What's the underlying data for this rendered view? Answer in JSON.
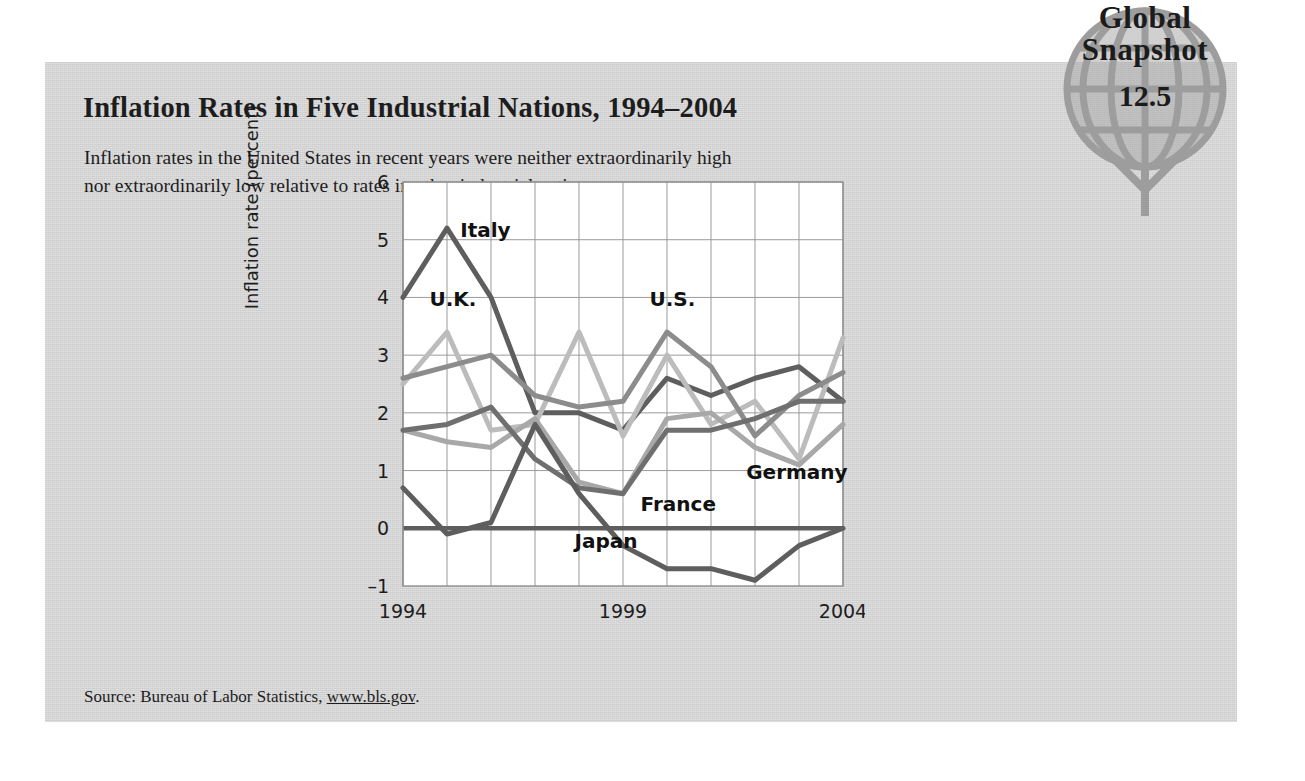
{
  "badge": {
    "line1": "Global",
    "line2": "Snapshot",
    "number": "12.5",
    "icon": "globe-icon",
    "color": "#a9a9a9"
  },
  "card": {
    "title": "Inflation Rates in Five Industrial Nations, 1994–2004",
    "subtitle": "Inflation rates in the United States in recent years were neither extraordinarily high nor extraordinarily low relative to rates in other industrial nations.",
    "source_prefix": "Source: Bureau of Labor Statistics, ",
    "source_url": "www.bls.gov",
    "source_suffix": ".",
    "background": "#d2d2d2"
  },
  "chart_data": {
    "type": "line",
    "title": "Inflation Rates in Five Industrial Nations, 1994–2004",
    "xlabel": "",
    "ylabel": "Inflation rate (percent)",
    "grid": true,
    "legend_position": "inline-annotations",
    "xlim": [
      1994,
      2004
    ],
    "ylim": [
      -1,
      6
    ],
    "yticks": [
      -1,
      0,
      1,
      2,
      3,
      4,
      5,
      6
    ],
    "ytick_labels": [
      "–1",
      "0",
      "1",
      "2",
      "3",
      "4",
      "5",
      "6"
    ],
    "x": [
      1994,
      1995,
      1996,
      1997,
      1998,
      1999,
      2000,
      2001,
      2002,
      2003,
      2004
    ],
    "xtick_labels": [
      "1994",
      "",
      "",
      "",
      "",
      "1999",
      "",
      "",
      "",
      "",
      "2004"
    ],
    "series": [
      {
        "name": "Italy",
        "color": "#5e5e5e",
        "label_x": 1995.3,
        "label_y": 5.05,
        "values": [
          4.0,
          5.2,
          4.0,
          2.0,
          2.0,
          1.7,
          2.6,
          2.3,
          2.6,
          2.8,
          2.2
        ]
      },
      {
        "name": "U.K.",
        "color": "#bcbcbc",
        "label_x": 1994.6,
        "label_y": 3.85,
        "values": [
          2.5,
          3.4,
          1.7,
          1.8,
          3.4,
          1.6,
          3.0,
          1.8,
          2.2,
          1.2,
          3.3
        ]
      },
      {
        "name": "U.S.",
        "color": "#8c8c8c",
        "label_x": 1999.6,
        "label_y": 3.85,
        "values": [
          2.6,
          2.8,
          3.0,
          2.3,
          2.1,
          2.2,
          3.4,
          2.8,
          1.6,
          2.3,
          2.7
        ]
      },
      {
        "name": "Germany",
        "color": "#a8a8a8",
        "label_x": 2001.8,
        "label_y": 0.85,
        "values": [
          1.7,
          1.5,
          1.4,
          1.9,
          0.8,
          0.6,
          1.9,
          2.0,
          1.4,
          1.1,
          1.8
        ]
      },
      {
        "name": "France",
        "color": "#6f6f6f",
        "label_x": 1999.4,
        "label_y": 0.3,
        "values": [
          1.7,
          1.8,
          2.1,
          1.2,
          0.7,
          0.6,
          1.7,
          1.7,
          1.9,
          2.2,
          2.2
        ]
      },
      {
        "name": "Japan",
        "color": "#5e5e5e",
        "label_x": 1997.9,
        "label_y": -0.35,
        "values": [
          0.7,
          -0.1,
          0.1,
          1.8,
          0.6,
          -0.3,
          -0.7,
          -0.7,
          -0.9,
          -0.3,
          0.0
        ]
      }
    ],
    "annotations": [
      "Italy",
      "U.K.",
      "U.S.",
      "Germany",
      "France",
      "Japan"
    ]
  }
}
